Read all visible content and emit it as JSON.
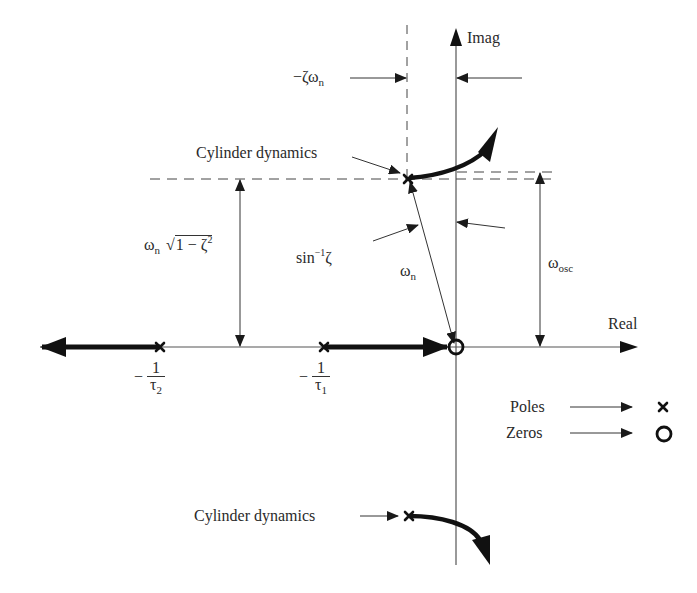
{
  "axes": {
    "imag_label": "Imag",
    "real_label": "Real"
  },
  "labels": {
    "zeta_wn": "−ζω",
    "zeta_wn_sub": "n",
    "cyl_upper": "Cylinder dynamics",
    "cyl_lower": "Cylinder dynamics",
    "wn_sqrt_w": "ω",
    "wn_sqrt_sub": "n",
    "wn_sqrt_body": "1 − ζ",
    "wn_sqrt_sup": "2",
    "asin": "sin",
    "asin_sup": "−1",
    "asin_arg": "ζ",
    "wn": "ω",
    "wn_sub": "n",
    "wosc": "ω",
    "wosc_sub": "osc",
    "tau2_minus": "−",
    "tau2_num": "1",
    "tau2_den": "τ",
    "tau2_sub": "2",
    "tau1_minus": "−",
    "tau1_num": "1",
    "tau1_den": "τ",
    "tau1_sub": "1"
  },
  "legend": {
    "poles_label": "Poles",
    "poles_symbol": "x",
    "zeros_label": "Zeros",
    "zeros_symbol": "o"
  },
  "colors": {
    "line": "#333333",
    "locus": "#1a1a1a",
    "dashed": "#444444"
  }
}
